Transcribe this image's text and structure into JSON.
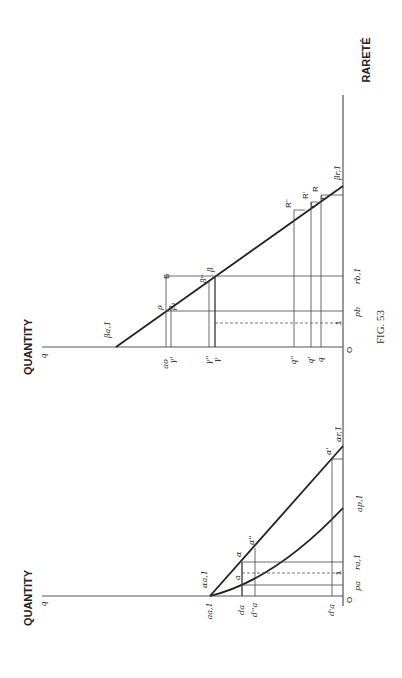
{
  "figure": {
    "caption": "FIG. 53",
    "orientation": "rotated 90 degrees counter-clockwise",
    "rarete_axis_label": "RARETÉ",
    "origin_label": "O"
  },
  "upper_diagram": {
    "axis_label": "QUANTITY",
    "axis_end_label": "q",
    "curve_labels": {
      "start": "βa,1",
      "end": "βr,1"
    },
    "point_labels": {
      "rho": "ρ",
      "beta1": "β₁",
      "beta": "β",
      "beta_dd": "β''",
      "B": "B",
      "R": "R",
      "R_p": "R'",
      "R_pp": "R''",
      "r_p": "r'",
      "r": "r"
    },
    "quantity_ticks": [
      "ao",
      "γ'",
      "γ''",
      "γ",
      "q''",
      "q'",
      "q"
    ],
    "rarete_ticks": [
      "pb",
      "rb,1",
      "1"
    ]
  },
  "lower_diagram": {
    "axis_label": "QUANTITY",
    "axis_end_label": "q",
    "curve_labels": {
      "line_start": "αa,1",
      "line_end": "αr,1",
      "curve_start": "a",
      "curve_end": "ap,1"
    },
    "point_labels": {
      "alpha": "α",
      "alpha_p": "α'",
      "alpha_pp": "α''"
    },
    "quantity_ticks": [
      "aa,1",
      "da",
      "d''a",
      "d'a"
    ],
    "rarete_ticks": [
      "pa",
      "1",
      "ra,1"
    ]
  }
}
